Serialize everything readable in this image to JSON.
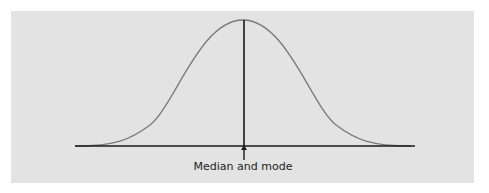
{
  "figure": {
    "type": "normal-distribution",
    "annotation": "Median and mode",
    "colors": {
      "background": "#e3e3e3",
      "curve": "#7a7a7a",
      "axis": "#1a1a1a"
    }
  }
}
